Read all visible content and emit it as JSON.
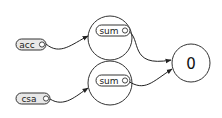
{
  "diagram": {
    "inputs": [
      {
        "id": "acc",
        "label": "acc"
      },
      {
        "id": "csa",
        "label": "csa"
      }
    ],
    "operators": [
      {
        "id": "sum1",
        "label": "sum"
      },
      {
        "id": "sum2",
        "label": "sum"
      }
    ],
    "output": {
      "id": "zero",
      "label": "0"
    },
    "edges": [
      {
        "from": "acc",
        "to": "sum1"
      },
      {
        "from": "csa",
        "to": "sum2"
      },
      {
        "from": "sum1",
        "to": "zero"
      },
      {
        "from": "sum2",
        "to": "zero"
      }
    ],
    "colors": {
      "stroke": "#333333",
      "input_fill": "#e8e8e8",
      "pill_fill": "#ffffff",
      "background": "#ffffff"
    }
  }
}
